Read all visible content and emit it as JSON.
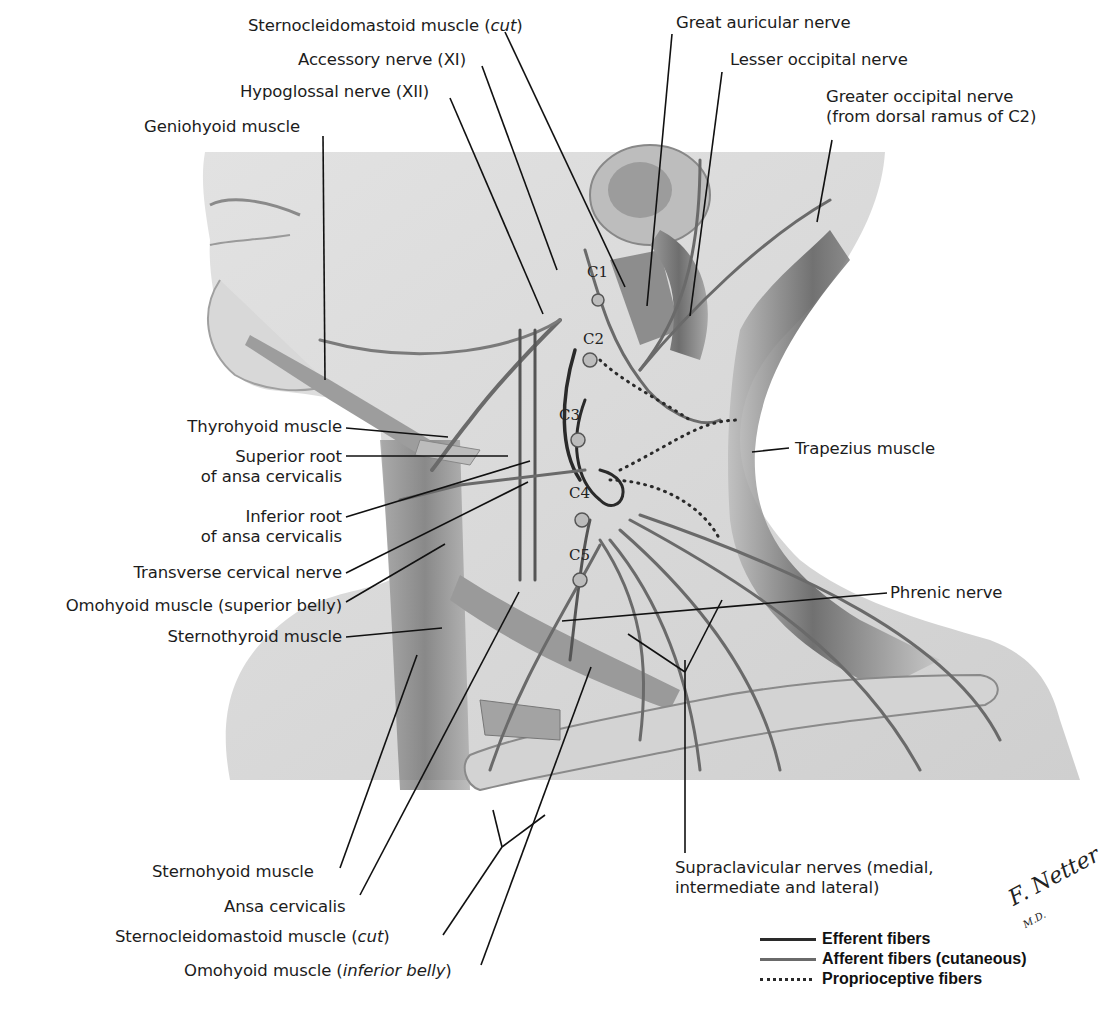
{
  "figure": {
    "labels_top": {
      "scm_cut_top": {
        "text": "Sternocleidomastoid muscle (",
        "italic": "cut",
        "close": ")"
      },
      "accessory": "Accessory nerve (XI)",
      "hypoglossal": "Hypoglossal nerve (XII)",
      "geniohyoid": "Geniohyoid muscle",
      "great_auricular": "Great auricular nerve",
      "lesser_occipital": "Lesser occipital nerve",
      "greater_occipital_1": "Greater occipital nerve",
      "greater_occipital_2": "(from dorsal ramus of C2)"
    },
    "labels_left": {
      "thyrohyoid": "Thyrohyoid muscle",
      "superior_root_1": "Superior root",
      "superior_root_2": "of ansa cervicalis",
      "inferior_root_1": "Inferior root",
      "inferior_root_2": "of ansa cervicalis",
      "transverse_cervical": "Transverse cervical nerve",
      "omohyoid_superior": "Omohyoid muscle (superior belly)",
      "sternothyroid": "Sternothyroid muscle"
    },
    "labels_right": {
      "trapezius": "Trapezius muscle",
      "phrenic": "Phrenic nerve",
      "supraclavicular_1": "Supraclavicular nerves (medial,",
      "supraclavicular_2": "intermediate and lateral)"
    },
    "labels_bottom": {
      "sternohyoid": "Sternohyoid muscle",
      "ansa": "Ansa cervicalis",
      "scm_cut_bottom": {
        "text": "Sternocleidomastoid muscle (",
        "italic": "cut",
        "close": ")"
      },
      "omohyoid_inferior": {
        "text": "Omohyoid muscle (",
        "italic": "inferior belly",
        "close": ")"
      }
    },
    "cervical_levels": [
      "C1",
      "C2",
      "C3",
      "C4",
      "C5"
    ],
    "signature": {
      "name": "F. Netter",
      "suffix": "M.D."
    }
  },
  "legend": {
    "items": [
      {
        "label": "Efferent fibers",
        "style": "solid-dark",
        "color": "#2a2a2a"
      },
      {
        "label": "Afferent fibers (cutaneous)",
        "style": "solid-gray",
        "color": "#6a6a6a"
      },
      {
        "label": "Proprioceptive fibers",
        "style": "dotted",
        "color": "#2a2a2a"
      }
    ]
  }
}
